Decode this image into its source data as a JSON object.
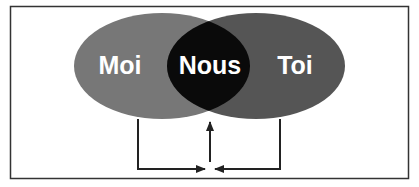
{
  "diagram": {
    "type": "venn",
    "sets": [
      {
        "id": "left",
        "label": "Moi",
        "color": "#777777"
      },
      {
        "id": "right",
        "label": "Toi",
        "color": "#555555"
      }
    ],
    "intersection": {
      "label": "Nous",
      "color": "#0a0a0a"
    },
    "arrows": [
      {
        "from": "Moi",
        "to": "convergence-point"
      },
      {
        "from": "Toi",
        "to": "convergence-point"
      },
      {
        "from": "convergence-point",
        "to": "Nous"
      }
    ],
    "colors": {
      "frame": "#333333",
      "background": "#ffffff",
      "text": "#ffffff",
      "arrow": "#222222"
    }
  }
}
